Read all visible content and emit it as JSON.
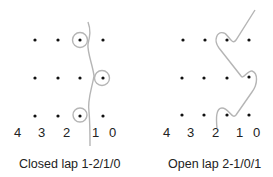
{
  "colors": {
    "dot": "#111111",
    "yarn": "#b5b5b5",
    "text": "#222222"
  },
  "diagrams": [
    {
      "caption": "Closed lap 1-2/1/0",
      "needle_labels": [
        "4",
        "3",
        "2",
        "1",
        "0"
      ]
    },
    {
      "caption": "Open lap 2-1/0/1",
      "needle_labels": [
        "4",
        "3",
        "2",
        "1",
        "0"
      ]
    }
  ]
}
